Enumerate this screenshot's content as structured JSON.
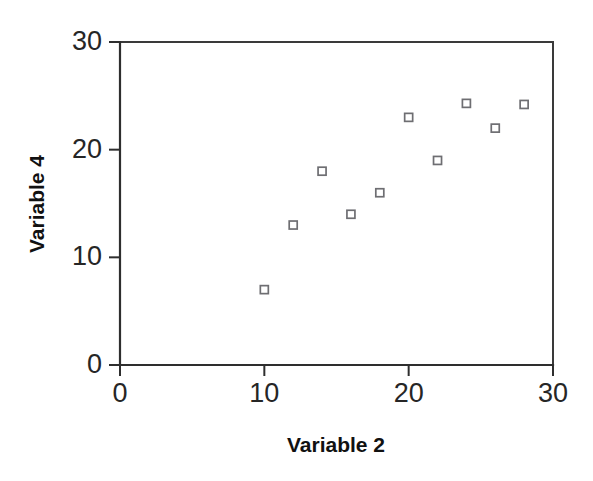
{
  "chart_data": {
    "type": "scatter",
    "title": "",
    "xlabel": "Variable 2",
    "ylabel": "Variable 4",
    "xlim": [
      0,
      30
    ],
    "ylim": [
      0,
      30
    ],
    "xticks": [
      0,
      10,
      20,
      30
    ],
    "yticks": [
      0,
      10,
      20,
      30
    ],
    "xtick_labels": [
      "0",
      "10",
      "20",
      "30"
    ],
    "ytick_labels": [
      "0",
      "10",
      "20",
      "30"
    ],
    "grid": false,
    "legend": null,
    "series": [
      {
        "name": "Variable 4 vs Variable 2",
        "marker": "open-square",
        "marker_color": "#6e6e72",
        "points": [
          {
            "x": 10,
            "y": 7
          },
          {
            "x": 12,
            "y": 13
          },
          {
            "x": 14,
            "y": 18
          },
          {
            "x": 16,
            "y": 14
          },
          {
            "x": 18,
            "y": 16
          },
          {
            "x": 20,
            "y": 23
          },
          {
            "x": 22,
            "y": 19
          },
          {
            "x": 24,
            "y": 24.3
          },
          {
            "x": 26,
            "y": 22
          },
          {
            "x": 28,
            "y": 24.2
          }
        ]
      }
    ]
  },
  "style": {
    "background": "#ffffff",
    "axis_color": "#2e2e2e",
    "frame_color": "#3a3a3a",
    "text_color": "#262626"
  }
}
